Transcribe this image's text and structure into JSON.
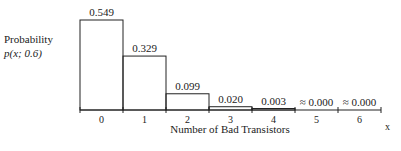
{
  "chart_data": {
    "type": "bar",
    "title": "",
    "ylabel_line1": "Probability",
    "ylabel_line2": "p(x; 0.6)",
    "xlabel": "Number of Bad Transistors",
    "x_axis_symbol": "x",
    "categories": [
      "0",
      "1",
      "2",
      "3",
      "4",
      "5",
      "6"
    ],
    "values": [
      0.549,
      0.329,
      0.099,
      0.02,
      0.003,
      0.0,
      0.0
    ],
    "value_labels": [
      "0.549",
      "0.329",
      "0.099",
      "0.020",
      "0.003",
      "≈ 0.000",
      "≈ 0.000"
    ],
    "ylim": [
      0,
      0.6
    ],
    "grid": false
  }
}
